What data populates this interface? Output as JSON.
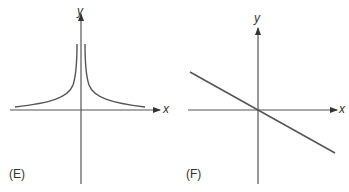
{
  "panels": [
    {
      "id": "E",
      "label": "(E)",
      "x_axis_label": "x",
      "y_axis_label": "y",
      "description": "Two branches symmetric about the y-axis, approaching the y-axis asymptotically upward and the x-axis asymptotically toward ±infinity (like y = 1/|x|)"
    },
    {
      "id": "F",
      "label": "(F)",
      "x_axis_label": "x",
      "y_axis_label": "y",
      "description": "Straight line through the origin with negative slope"
    }
  ],
  "colors": {
    "axis": "#555555",
    "curve": "#555555"
  }
}
